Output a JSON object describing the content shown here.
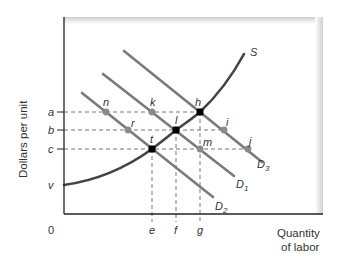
{
  "diagram": {
    "title": "",
    "y_axis_label": "Dollars per unit",
    "x_axis_label_line1": "Quantity",
    "x_axis_label_line2": "of labor",
    "origin_label": "0",
    "y_ticks": {
      "a": "a",
      "b": "b",
      "c": "c",
      "v": "v"
    },
    "x_ticks": {
      "e": "e",
      "f": "f",
      "g": "g"
    },
    "curves": {
      "S": {
        "label": "S",
        "color": "#444444"
      },
      "D1": {
        "label": "D",
        "sub": "1",
        "color": "#7a7a7a"
      },
      "D2": {
        "label": "D",
        "sub": "2",
        "color": "#7a7a7a"
      },
      "D3": {
        "label": "D",
        "sub": "3",
        "color": "#7a7a7a"
      }
    },
    "equilibrium_points": {
      "h": "h",
      "l": "l",
      "t": "t"
    },
    "other_points": {
      "n": "n",
      "k": "k",
      "r": "r",
      "i": "i",
      "m": "m",
      "j": "j"
    },
    "colors": {
      "axis": "#222222",
      "supply": "#444444",
      "demand": "#7a7a7a",
      "equilibrium_dot": "#000000",
      "point_dot": "#8a8a8a",
      "dashed": "#777777",
      "panel_shadow": "#d9d9d9"
    }
  }
}
